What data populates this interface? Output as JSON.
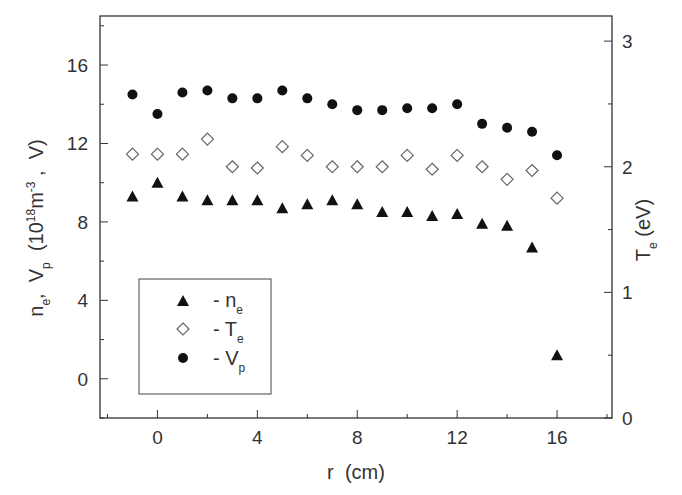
{
  "chart_data": {
    "type": "scatter",
    "title": "",
    "xlabel": "r  (cm)",
    "ylabel": "n_e, V_p  (10^18 m^-3 , V)",
    "ylabel_right": "T_e (eV)",
    "xlim": [
      -2.3,
      18.2
    ],
    "ylim": [
      -2,
      18.5
    ],
    "ylim_right": [
      0,
      3.2
    ],
    "x_ticks": [
      0,
      4,
      8,
      12,
      16
    ],
    "y_ticks": [
      0,
      4,
      8,
      12,
      16
    ],
    "y_ticks_right": [
      0,
      1,
      2,
      3
    ],
    "grid": false,
    "legend_position": "lower-left inside",
    "x": [
      -1,
      0,
      1,
      2,
      3,
      4,
      5,
      6,
      7,
      8,
      9,
      10,
      11,
      12,
      13,
      14,
      15,
      16
    ],
    "series": [
      {
        "name": "n_e",
        "label": "- n",
        "subscript": "e",
        "marker": "filled-triangle",
        "axis": "left",
        "values": [
          9.3,
          10.0,
          9.3,
          9.1,
          9.1,
          9.1,
          8.7,
          8.9,
          9.1,
          8.9,
          8.5,
          8.5,
          8.3,
          8.4,
          7.9,
          7.8,
          6.7,
          1.2
        ]
      },
      {
        "name": "T_e",
        "label": "- T",
        "subscript": "e",
        "marker": "open-diamond",
        "axis": "right",
        "values": [
          2.1,
          2.1,
          2.1,
          2.22,
          2.0,
          1.99,
          2.16,
          2.09,
          2.0,
          2.0,
          2.0,
          2.09,
          1.98,
          2.09,
          2.0,
          1.9,
          1.97,
          1.75
        ]
      },
      {
        "name": "V_p",
        "label": "- V",
        "subscript": "p",
        "marker": "filled-circle",
        "axis": "left",
        "values": [
          14.5,
          13.5,
          14.6,
          14.7,
          14.3,
          14.3,
          14.7,
          14.3,
          14.0,
          13.7,
          13.7,
          13.8,
          13.8,
          14.0,
          13.0,
          12.8,
          12.6,
          11.4
        ]
      }
    ]
  },
  "legend": {
    "items": [
      {
        "text": "-  n",
        "sub": "e"
      },
      {
        "text": "-  T",
        "sub": "e"
      },
      {
        "text": "-  V",
        "sub": "p"
      }
    ]
  },
  "axes": {
    "x_label": "r  (cm)",
    "y_left_label_parts": [
      "n",
      "e",
      ",  V",
      "p",
      "  (10",
      "18",
      "m",
      "-3",
      " ,  V)"
    ],
    "y_right_label_parts": [
      "T",
      "e",
      " (eV)"
    ]
  }
}
